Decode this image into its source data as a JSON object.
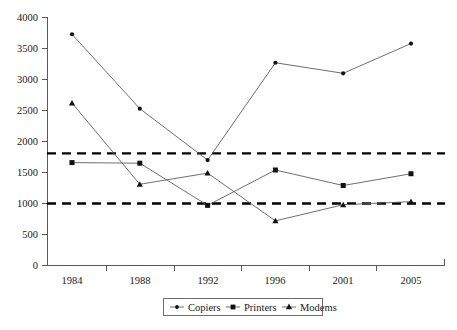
{
  "chart_data": {
    "type": "line",
    "title": "",
    "subtitle": "",
    "xlabel": "",
    "ylabel": "",
    "categories": [
      "1984",
      "1988",
      "1992",
      "1996",
      "2001",
      "2005"
    ],
    "x": [
      1984,
      1988,
      1992,
      1996,
      2001,
      2005
    ],
    "ylim": [
      0,
      4000
    ],
    "y_ticks": [
      0,
      500,
      1000,
      1500,
      2000,
      2500,
      3000,
      3500,
      4000
    ],
    "y_tick_labels": [
      "0",
      "500",
      "1000",
      "1500",
      "2000",
      "2500",
      "3000",
      "3500",
      "4000"
    ],
    "grid": false,
    "legend_position": "bottom-center",
    "series": [
      {
        "name": "Copiers",
        "marker": "dot",
        "values": [
          3730,
          2530,
          1700,
          3270,
          3100,
          3580
        ]
      },
      {
        "name": "Printers",
        "marker": "square",
        "values": [
          1660,
          1650,
          970,
          1540,
          1290,
          1480
        ]
      },
      {
        "name": "Modems",
        "marker": "triangle",
        "values": [
          2620,
          1310,
          1490,
          720,
          980,
          1030
        ]
      }
    ],
    "reference_lines": [
      {
        "name": "upper-threshold",
        "value": 1800,
        "style": "dashed"
      },
      {
        "name": "lower-threshold",
        "value": 1000,
        "style": "dashed"
      }
    ],
    "colors": {
      "line": "#5e5e5e",
      "marker": "#111111",
      "axis": "#5a5a5a",
      "reference": "#000000",
      "background": "#ffffff"
    }
  },
  "legend": {
    "items": [
      {
        "label": "Copiers",
        "marker": "dot"
      },
      {
        "label": "Printers",
        "marker": "square"
      },
      {
        "label": "Modems",
        "marker": "triangle"
      }
    ]
  }
}
